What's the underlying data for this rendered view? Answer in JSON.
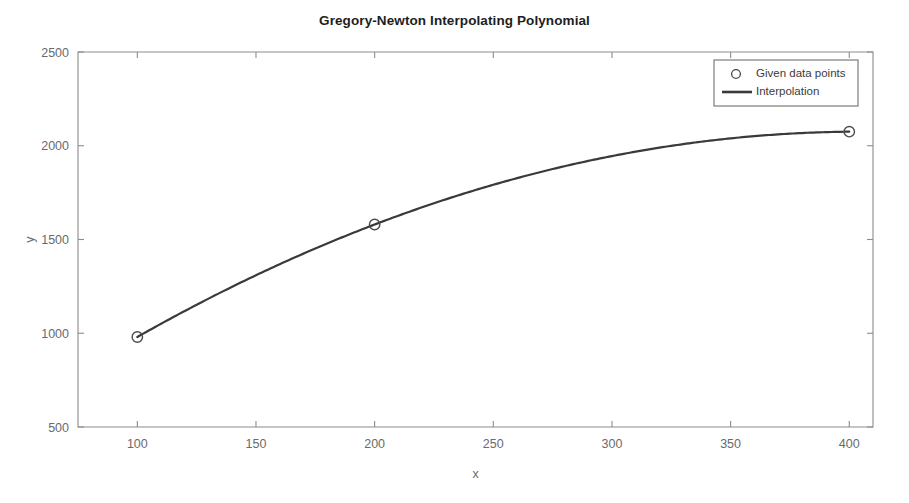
{
  "figure": {
    "title": "Gregory-Newton Interpolating Polynomial",
    "background_color": "#ffffff",
    "axis_color": "#8c8c8c",
    "curve_color": "#3a3a3a",
    "marker_color": "#4a4a4a"
  },
  "axes": {
    "x_label": "x",
    "y_label": "y",
    "x_ticks": [
      "100",
      "150",
      "200",
      "250",
      "300",
      "350",
      "400"
    ],
    "y_ticks": [
      "2500",
      "2000",
      "1500",
      "1000",
      "500"
    ]
  },
  "legend": {
    "position": "top-right",
    "entries": [
      {
        "label": "Given data points",
        "marker": "circle-marker-icon"
      },
      {
        "label": "Interpolation",
        "marker": "line-marker-icon"
      }
    ]
  },
  "chart_data": {
    "type": "line",
    "title": "Gregory-Newton Interpolating Polynomial",
    "xlabel": "x",
    "ylabel": "y",
    "xlim": [
      75,
      410
    ],
    "ylim": [
      500,
      2500
    ],
    "xticks": [
      100,
      150,
      200,
      250,
      300,
      350,
      400
    ],
    "yticks": [
      500,
      1000,
      1500,
      2000,
      2500
    ],
    "grid": false,
    "legend_position": "upper right",
    "series": [
      {
        "name": "Given data points",
        "type": "scatter",
        "marker": "o",
        "x": [
          100,
          200,
          400
        ],
        "y": [
          980,
          1580,
          2075
        ]
      },
      {
        "name": "Interpolation",
        "type": "line",
        "x": [
          100,
          110,
          120,
          130,
          140,
          150,
          160,
          170,
          180,
          190,
          200,
          210,
          220,
          230,
          240,
          250,
          260,
          270,
          280,
          290,
          300,
          310,
          320,
          330,
          340,
          350,
          360,
          370,
          380,
          390,
          400
        ],
        "y": [
          980,
          1044,
          1106,
          1167,
          1226,
          1284,
          1340,
          1394,
          1447,
          1498,
          1548,
          1596,
          1642,
          1687,
          1730,
          1772,
          1812,
          1850,
          1887,
          1922,
          1956,
          1988,
          2018,
          2047,
          2074,
          2100,
          2124,
          2146,
          2167,
          2186,
          2075
        ]
      }
    ]
  }
}
